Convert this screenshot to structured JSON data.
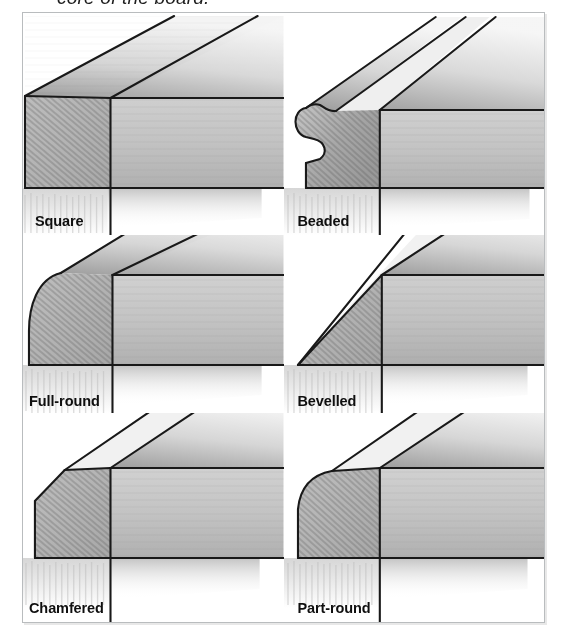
{
  "caption": {
    "text": "core of the board.",
    "clipped": true
  },
  "figure": {
    "frame_color": "#b9bcbe",
    "background": "#ffffff",
    "drawing_style": "pencil-shaded isometric cutaway",
    "ink_color": "#1a1a1a",
    "end_grain_fill": "#b7b7b7",
    "face_fill": "#c9c9c9",
    "top_face_fill": "#e3e3e3"
  },
  "profiles": [
    {
      "id": "square",
      "label": "Square",
      "shape": "square",
      "description": "Un-machined square arris at the board edge",
      "row": 1,
      "column": 1
    },
    {
      "id": "beaded",
      "label": "Beaded",
      "shape": "bead-with-quirk",
      "description": "Half-round bead separated from the face by a quirk groove",
      "row": 1,
      "column": 2
    },
    {
      "id": "full-round",
      "label": "Full-round",
      "shape": "large-radius",
      "description": "Edge rounded over to a full half-thickness radius",
      "row": 2,
      "column": 1
    },
    {
      "id": "bevelled",
      "label": "Bevelled",
      "shape": "full-bevel",
      "description": "Edge planed to a long 45 degree bevel across the full thickness",
      "row": 2,
      "column": 2
    },
    {
      "id": "chamfered",
      "label": "Chamfered",
      "shape": "small-bevel",
      "description": "Small 45 degree chamfer taken off the top arris",
      "row": 3,
      "column": 1
    },
    {
      "id": "part-round",
      "label": "Part-round",
      "shape": "small-radius",
      "description": "Top arris rounded over to a small radius",
      "row": 3,
      "column": 2
    }
  ]
}
